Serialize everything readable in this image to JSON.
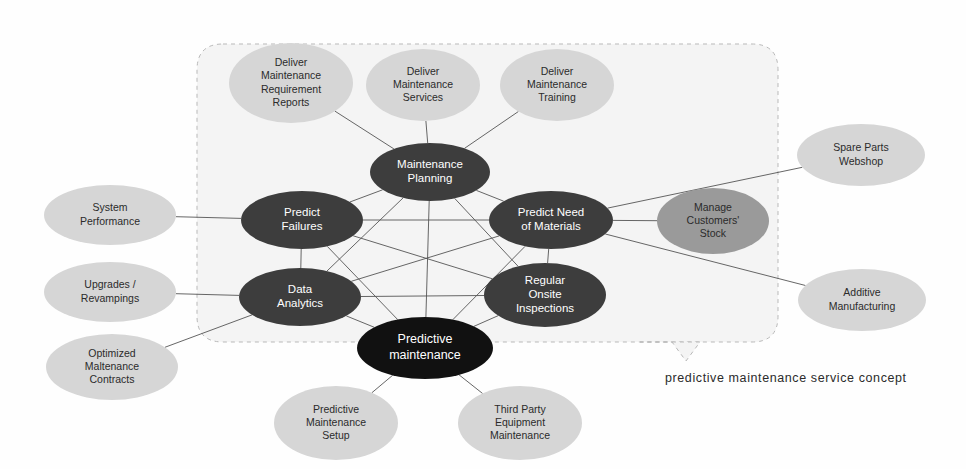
{
  "diagram": {
    "caption": "predictive maintenance service concept",
    "boundary_label": "",
    "colors": {
      "core_fill": "#111111",
      "capability_fill": "#3d3d3d",
      "mid_fill": "#9a9a9a",
      "outer_fill": "#d6d6d6",
      "edge_stroke": "#555555",
      "boundary_stroke": "#b9b9b9",
      "boundary_fill": "#f4f4f4",
      "light_text": "#ffffff",
      "dark_text": "#2b2b2b"
    },
    "nodes": [
      {
        "id": "deliver_reports",
        "label": "Deliver\nMaintenance\nRequirement\nReports",
        "tier": "outer",
        "cx": 291,
        "cy": 83,
        "rx": 62,
        "ry": 40
      },
      {
        "id": "deliver_services",
        "label": "Deliver\nMaintenance\nServices",
        "tier": "outer",
        "cx": 423,
        "cy": 85,
        "rx": 57,
        "ry": 36
      },
      {
        "id": "deliver_training",
        "label": "Deliver\nMaintenance\nTraining",
        "tier": "outer",
        "cx": 557,
        "cy": 85,
        "rx": 57,
        "ry": 36
      },
      {
        "id": "maintenance_planning",
        "label": "Maintenance\nPlanning",
        "tier": "capability",
        "cx": 430,
        "cy": 172,
        "rx": 60,
        "ry": 29
      },
      {
        "id": "predict_failures",
        "label": "Predict\nFailures",
        "tier": "capability",
        "cx": 302,
        "cy": 220,
        "rx": 61,
        "ry": 29
      },
      {
        "id": "predict_materials",
        "label": "Predict Need\nof Materials",
        "tier": "capability",
        "cx": 551,
        "cy": 220,
        "rx": 62,
        "ry": 29
      },
      {
        "id": "data_analytics",
        "label": "Data\nAnalytics",
        "tier": "capability",
        "cx": 300,
        "cy": 297,
        "rx": 61,
        "ry": 29
      },
      {
        "id": "onsite_inspections",
        "label": "Regular\nOnsite\nInspections",
        "tier": "capability",
        "cx": 545,
        "cy": 295,
        "rx": 61,
        "ry": 32
      },
      {
        "id": "predictive_maintenance",
        "label": "Predictive\nmaintenance",
        "tier": "core",
        "cx": 425,
        "cy": 348,
        "rx": 68,
        "ry": 31
      },
      {
        "id": "system_performance",
        "label": "System\nPerformance",
        "tier": "outer",
        "cx": 110,
        "cy": 215,
        "rx": 66,
        "ry": 30
      },
      {
        "id": "upgrades_revampings",
        "label": "Upgrades /\nRevampings",
        "tier": "outer",
        "cx": 110,
        "cy": 292,
        "rx": 66,
        "ry": 30
      },
      {
        "id": "optimized_contracts",
        "label": "Optimized\nMaltenance\nContracts",
        "tier": "outer",
        "cx": 112,
        "cy": 367,
        "rx": 66,
        "ry": 33
      },
      {
        "id": "spare_parts_webshop",
        "label": "Spare Parts\nWebshop",
        "tier": "outer",
        "cx": 861,
        "cy": 155,
        "rx": 64,
        "ry": 31
      },
      {
        "id": "manage_customers_stock",
        "label": "Manage\nCustomers'\nStock",
        "tier": "mid",
        "cx": 713,
        "cy": 221,
        "rx": 56,
        "ry": 33
      },
      {
        "id": "additive_manufacturing",
        "label": "Additive\nManufacturing",
        "tier": "outer",
        "cx": 862,
        "cy": 300,
        "rx": 64,
        "ry": 31
      },
      {
        "id": "predictive_setup",
        "label": "Predictive\nMaintenance\nSetup",
        "tier": "outer",
        "cx": 336,
        "cy": 423,
        "rx": 62,
        "ry": 37
      },
      {
        "id": "third_party_equipment",
        "label": "Third Party\nEquipment\nMaintenance",
        "tier": "outer",
        "cx": 520,
        "cy": 423,
        "rx": 62,
        "ry": 37
      }
    ],
    "edges": [
      {
        "from": "deliver_reports",
        "to": "maintenance_planning"
      },
      {
        "from": "deliver_services",
        "to": "maintenance_planning"
      },
      {
        "from": "deliver_training",
        "to": "maintenance_planning"
      },
      {
        "from": "maintenance_planning",
        "to": "predict_failures"
      },
      {
        "from": "maintenance_planning",
        "to": "predict_materials"
      },
      {
        "from": "maintenance_planning",
        "to": "data_analytics"
      },
      {
        "from": "maintenance_planning",
        "to": "onsite_inspections"
      },
      {
        "from": "maintenance_planning",
        "to": "predictive_maintenance"
      },
      {
        "from": "predict_failures",
        "to": "predict_materials"
      },
      {
        "from": "predict_failures",
        "to": "data_analytics"
      },
      {
        "from": "predict_failures",
        "to": "onsite_inspections"
      },
      {
        "from": "predict_failures",
        "to": "predictive_maintenance"
      },
      {
        "from": "predict_materials",
        "to": "data_analytics"
      },
      {
        "from": "predict_materials",
        "to": "onsite_inspections"
      },
      {
        "from": "predict_materials",
        "to": "predictive_maintenance"
      },
      {
        "from": "data_analytics",
        "to": "onsite_inspections"
      },
      {
        "from": "data_analytics",
        "to": "predictive_maintenance"
      },
      {
        "from": "onsite_inspections",
        "to": "predictive_maintenance"
      },
      {
        "from": "system_performance",
        "to": "predict_failures"
      },
      {
        "from": "upgrades_revampings",
        "to": "data_analytics"
      },
      {
        "from": "optimized_contracts",
        "to": "data_analytics"
      },
      {
        "from": "predict_materials",
        "to": "spare_parts_webshop"
      },
      {
        "from": "predict_materials",
        "to": "manage_customers_stock"
      },
      {
        "from": "predict_materials",
        "to": "additive_manufacturing"
      },
      {
        "from": "predictive_maintenance",
        "to": "predictive_setup"
      },
      {
        "from": "predictive_maintenance",
        "to": "third_party_equipment"
      }
    ],
    "boundary": {
      "shape": "rounded-rect-with-callout-tail",
      "x": 197,
      "y": 44,
      "width": 581,
      "height": 298,
      "radius": 26,
      "tail_points": "640,342 700,342 686,361 672,342"
    }
  }
}
